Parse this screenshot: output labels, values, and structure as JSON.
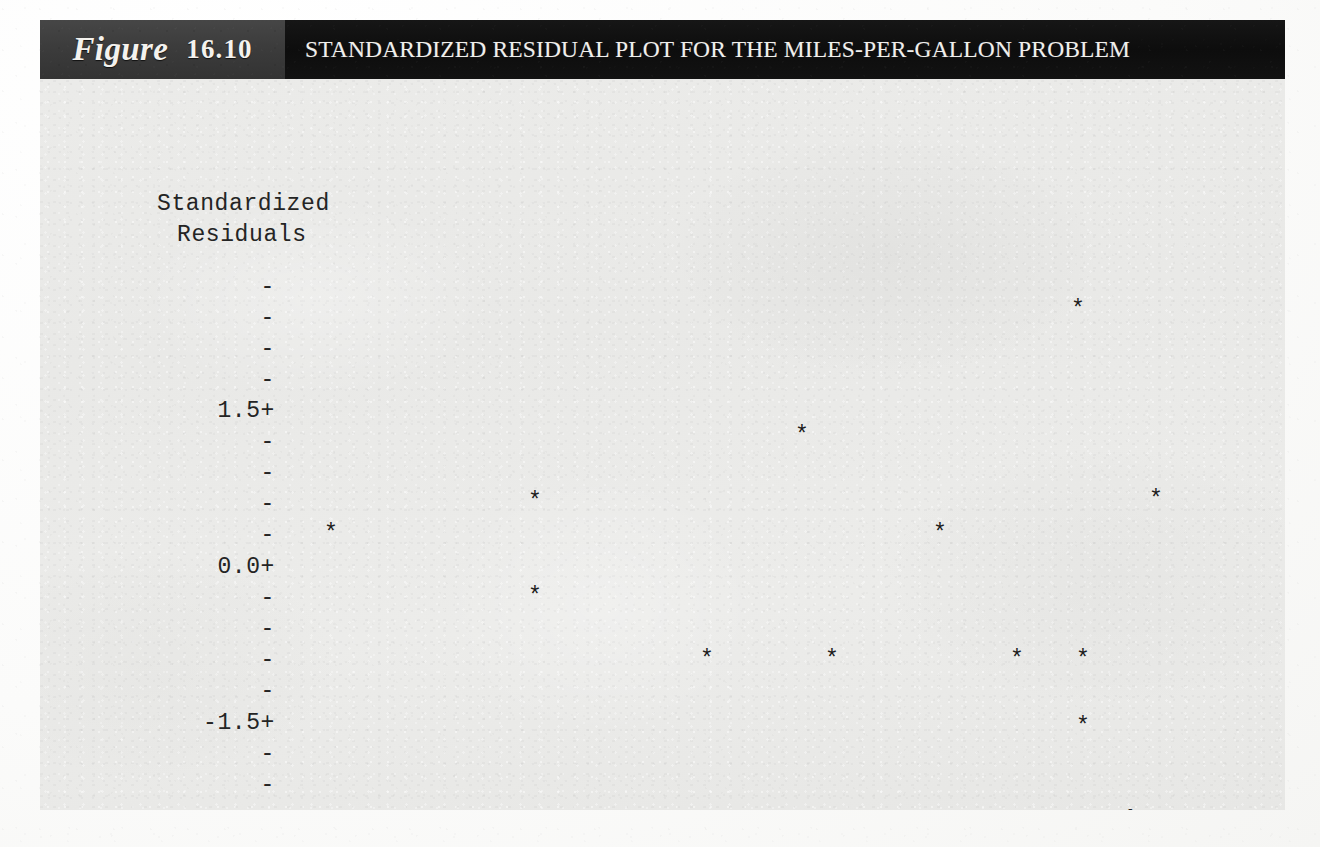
{
  "figure": {
    "label_word": "Figure",
    "number": "16.10",
    "title": "STANDARDIZED RESIDUAL PLOT FOR THE MILES-PER-GALLON PROBLEM"
  },
  "colors": {
    "label_band": "#3c3c3c",
    "title_band": "#0d0d0d",
    "plot_background": "#eaeaea",
    "ink": "#242424",
    "marker": "#1c1c1c"
  },
  "axes": {
    "y_title_line1": "Standardized",
    "y_title_line2": "Residuals",
    "x_axis_variable": "ŷ",
    "x_axis_rule": "--+---------+---------+---------+---------+---------+----",
    "y_ticks": [
      {
        "label": "-",
        "value": null,
        "y": 207
      },
      {
        "label": "-",
        "value": null,
        "y": 238
      },
      {
        "label": "-",
        "value": null,
        "y": 269
      },
      {
        "label": "-",
        "value": null,
        "y": 300
      },
      {
        "label": "1.5+",
        "value": 1.5,
        "y": 331
      },
      {
        "label": "-",
        "value": null,
        "y": 362
      },
      {
        "label": "-",
        "value": null,
        "y": 393
      },
      {
        "label": "-",
        "value": null,
        "y": 424
      },
      {
        "label": "-",
        "value": null,
        "y": 455
      },
      {
        "label": "0.0+",
        "value": 0.0,
        "y": 487
      },
      {
        "label": "-",
        "value": null,
        "y": 518
      },
      {
        "label": "-",
        "value": null,
        "y": 549
      },
      {
        "label": "-",
        "value": null,
        "y": 580
      },
      {
        "label": "-",
        "value": null,
        "y": 611
      },
      {
        "label": "-1.5+",
        "value": -1.5,
        "y": 643
      },
      {
        "label": "-",
        "value": null,
        "y": 674
      },
      {
        "label": "-",
        "value": null,
        "y": 705
      }
    ],
    "x_ticks": [
      {
        "label": "14.0",
        "value": 14.0,
        "x": 280
      },
      {
        "label": "17.5",
        "value": 17.5,
        "x": 424
      },
      {
        "label": "21.0",
        "value": 21.0,
        "x": 568
      },
      {
        "label": "24.5",
        "value": 24.5,
        "x": 712
      },
      {
        "label": "28.0",
        "value": 28.0,
        "x": 856
      },
      {
        "label": "31.5",
        "value": 31.5,
        "x": 1000
      }
    ]
  },
  "markers": {
    "glyph": "*",
    "points": [
      {
        "x": 291,
        "y": 455
      },
      {
        "x": 1038,
        "y": 231
      },
      {
        "x": 762,
        "y": 357
      },
      {
        "x": 495,
        "y": 423
      },
      {
        "x": 1116,
        "y": 421
      },
      {
        "x": 900,
        "y": 455
      },
      {
        "x": 495,
        "y": 518
      },
      {
        "x": 667,
        "y": 581
      },
      {
        "x": 792,
        "y": 581
      },
      {
        "x": 977,
        "y": 581
      },
      {
        "x": 1043,
        "y": 581
      },
      {
        "x": 1043,
        "y": 648
      }
    ]
  },
  "chart_data": {
    "type": "scatter",
    "title": "STANDARDIZED RESIDUAL PLOT FOR THE MILES-PER-GALLON PROBLEM",
    "subtitle": "",
    "xlabel": "ŷ",
    "ylabel": "Standardized Residuals",
    "grid": false,
    "legend_position": "none",
    "xlim": [
      12.6,
      35.0
    ],
    "ylim": [
      -2.2,
      2.7
    ],
    "xticks": [
      14.0,
      17.5,
      21.0,
      24.5,
      28.0,
      31.5
    ],
    "xticklabels": [
      "14.0",
      "17.5",
      "21.0",
      "24.5",
      "28.0",
      "31.5"
    ],
    "yticks": [
      1.5,
      0.0,
      -1.5
    ],
    "yticklabels": [
      "1.5+",
      "0.0+",
      "-1.5+"
    ],
    "series": [
      {
        "name": "Standardized residuals",
        "marker": "*",
        "x": [
          14.3,
          19.3,
          19.3,
          23.4,
          25.7,
          26.5,
          29.1,
          31.0,
          32.5,
          32.6,
          32.6,
          34.3
        ],
        "y": [
          0.31,
          0.62,
          -0.3,
          -0.9,
          1.25,
          -0.9,
          0.31,
          -0.9,
          2.46,
          -0.9,
          -1.55,
          0.63
        ]
      }
    ],
    "annotations": [
      "Figure 16.10"
    ]
  }
}
